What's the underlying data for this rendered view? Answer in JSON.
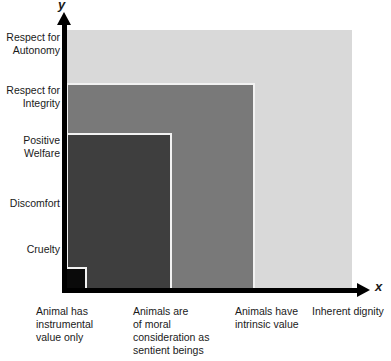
{
  "chart_data": {
    "type": "area",
    "title": "",
    "xlabel": "x",
    "ylabel": "y",
    "grid": false,
    "legend_position": "none",
    "x_axis": {
      "title": "x",
      "categories": [
        "Animal has instrumental value only",
        "Animals are of moral consideration as sentient beings",
        "Animals have intrinsic value",
        "Inherent dignity"
      ]
    },
    "y_axis": {
      "title": "y",
      "categories": [
        "Cruelty",
        "Discomfort",
        "Positive Welfare",
        "Respect for Integrity",
        "Respect for Autonomy"
      ]
    },
    "series": [
      {
        "name": "Animal has instrumental value only",
        "x_index": 0,
        "reaches_y_level": "Cruelty",
        "y_value": 1,
        "color": "#0a0a0a"
      },
      {
        "name": "Animals are of moral consideration as sentient beings",
        "x_index": 1,
        "reaches_y_level": "Positive Welfare",
        "y_value": 3,
        "color": "#3e3e3e"
      },
      {
        "name": "Animals have intrinsic value",
        "x_index": 2,
        "reaches_y_level": "Respect for Integrity",
        "y_value": 4,
        "color": "#797979"
      },
      {
        "name": "Inherent dignity",
        "x_index": 3,
        "reaches_y_level": "Respect for Autonomy",
        "y_value": 5,
        "color": "#d9d9d9"
      }
    ]
  },
  "axes": {
    "y_title": "y",
    "x_title": "x"
  },
  "y_labels": [
    {
      "line1": "Cruelty",
      "line2": ""
    },
    {
      "line1": "Discomfort",
      "line2": ""
    },
    {
      "line1": "Positive",
      "line2": "Welfare"
    },
    {
      "line1": "Respect for",
      "line2": "Integrity"
    },
    {
      "line1": "Respect for",
      "line2": "Autonomy"
    }
  ],
  "x_labels": [
    {
      "line1": "Animal has",
      "line2": "instrumental",
      "line3": "value only",
      "line4": ""
    },
    {
      "line1": "Animals are",
      "line2": "of moral",
      "line3": "consideration as",
      "line4": "sentient beings"
    },
    {
      "line1": "Animals have",
      "line2": "intrinsic value",
      "line3": "",
      "line4": ""
    },
    {
      "line1": "Inherent dignity",
      "line2": "",
      "line3": "",
      "line4": ""
    }
  ],
  "colors": {
    "band_instrumental_value": "#0a0a0a",
    "band_moral_consideration": "#3e3e3e",
    "band_intrinsic_value": "#797979",
    "band_inherent_dignity": "#d9d9d9",
    "axis": "#000000",
    "band_outline": "#f2f2f2",
    "background": "#ffffff",
    "text": "#1a1a1a"
  }
}
